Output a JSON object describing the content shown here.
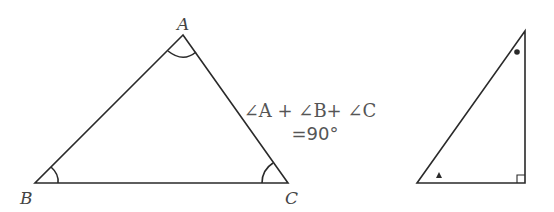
{
  "diagram": {
    "left_triangle": {
      "vertices": {
        "A": {
          "label": "A"
        },
        "B": {
          "label": "B"
        },
        "C": {
          "label": "C"
        }
      },
      "angle_marks": [
        "A",
        "B",
        "C"
      ]
    },
    "equation": {
      "line1": "∠A + ∠B+ ∠C",
      "line2": "=90°"
    },
    "right_triangle": {
      "marks": {
        "top_angle": "dot",
        "bottom_left_angle": "triangle",
        "bottom_right_angle": "right-angle-square"
      }
    },
    "colors": {
      "stroke": "#2a2a2a",
      "text": "#555555",
      "background": "#ffffff"
    }
  }
}
